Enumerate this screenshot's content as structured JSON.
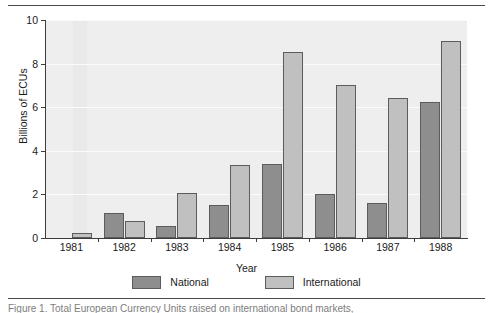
{
  "figure": {
    "top_rule": "",
    "bottom_rule": "",
    "caption_clipped": "Figure 1. Total European Currency Units raised on international bond markets,"
  },
  "chart_data": {
    "type": "bar",
    "title": "",
    "xlabel": "Year",
    "ylabel": "Billions of ECUs",
    "categories": [
      "1981",
      "1982",
      "1983",
      "1984",
      "1985",
      "1986",
      "1987",
      "1988"
    ],
    "series": [
      {
        "name": "National",
        "color": "#8e8e8e",
        "values": [
          0,
          1.15,
          0.55,
          1.5,
          3.4,
          2.0,
          1.6,
          6.25
        ]
      },
      {
        "name": "International",
        "color": "#c0c0c0",
        "values": [
          0.25,
          0.8,
          2.05,
          3.35,
          8.55,
          7.0,
          6.4,
          9.05
        ]
      }
    ],
    "ylim": [
      0,
      10
    ],
    "yticks": [
      "0",
      "2",
      "4",
      "6",
      "8",
      "10"
    ],
    "ytick_values": [
      0,
      2,
      4,
      6,
      8,
      10
    ],
    "grid": true,
    "legend_position": "bottom",
    "plot_background": "#eeeeee"
  }
}
